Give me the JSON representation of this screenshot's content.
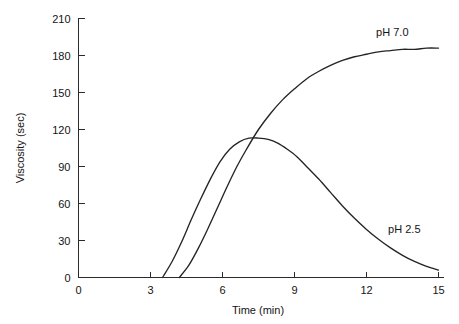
{
  "chart_data": {
    "type": "line",
    "title": "",
    "subtitle": "",
    "xlabel": "Time (min)",
    "ylabel": "Viscosity (sec)",
    "xlim": [
      0,
      15
    ],
    "ylim": [
      0,
      210
    ],
    "xticks": [
      0,
      3,
      6,
      9,
      12,
      15
    ],
    "yticks": [
      0,
      30,
      60,
      90,
      120,
      150,
      180,
      210
    ],
    "xtick_labels": [
      "0",
      "3",
      "6",
      "9",
      "12",
      "15"
    ],
    "ytick_labels": [
      "0",
      "30",
      "60",
      "90",
      "120",
      "150",
      "180",
      "210"
    ],
    "grid": false,
    "legend_position": "inline-annotations",
    "annotations": [
      {
        "text": "pH 7.0",
        "x": 12.4,
        "y": 196
      },
      {
        "text": "pH 2.5",
        "x": 12.9,
        "y": 36
      }
    ],
    "series": [
      {
        "name": "pH 7.0",
        "label": "pH 7.0",
        "color": "#242424",
        "x": [
          4.2,
          4.6,
          5.0,
          5.4,
          5.8,
          6.2,
          6.6,
          7.0,
          7.5,
          8.0,
          8.5,
          9.0,
          9.5,
          10.0,
          10.5,
          11.0,
          11.5,
          12.0,
          12.5,
          13.0,
          13.5,
          14.0,
          14.5,
          15.0
        ],
        "y": [
          0,
          10,
          24,
          40,
          57,
          74,
          90,
          104,
          120,
          133,
          144,
          153,
          161,
          167,
          172,
          176,
          179,
          181,
          183,
          184,
          185,
          185,
          186,
          186
        ]
      },
      {
        "name": "pH 2.5",
        "label": "pH 2.5",
        "color": "#242424",
        "x": [
          3.5,
          3.9,
          4.3,
          4.7,
          5.1,
          5.5,
          5.9,
          6.3,
          6.7,
          7.1,
          7.5,
          7.9,
          8.3,
          8.7,
          9.1,
          9.5,
          10.0,
          10.5,
          11.0,
          11.5,
          12.0,
          12.5,
          13.0,
          13.5,
          14.0,
          14.5,
          15.0
        ],
        "y": [
          0,
          13,
          29,
          47,
          64,
          80,
          94,
          104,
          110,
          113,
          113,
          112,
          109,
          104,
          98,
          90,
          80,
          69,
          58,
          48,
          39,
          31,
          24,
          18,
          13,
          9,
          6
        ]
      }
    ]
  },
  "axes": {
    "y_axis_title": "Viscosity (sec)",
    "x_axis_title": "Time (min)"
  },
  "labels": {
    "ph70": "pH 7.0",
    "ph25": "pH 2.5"
  }
}
